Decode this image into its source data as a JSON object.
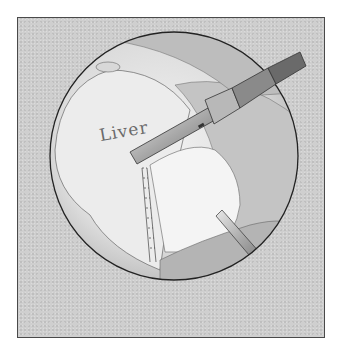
{
  "illustration": {
    "subject": "Laparoscopic liver resection with stapler",
    "organ_label": "Liver",
    "colors": {
      "background": "#cfcfcf",
      "frame_border": "#4a4a4a",
      "tissue_light": "#ececec",
      "tissue_mid": "#c8c8c8",
      "instrument": "#9a9a9a",
      "outline": "#2a2a2a"
    },
    "inset": {
      "description": "Magnified view of stapled tissue edges with arrow"
    }
  }
}
